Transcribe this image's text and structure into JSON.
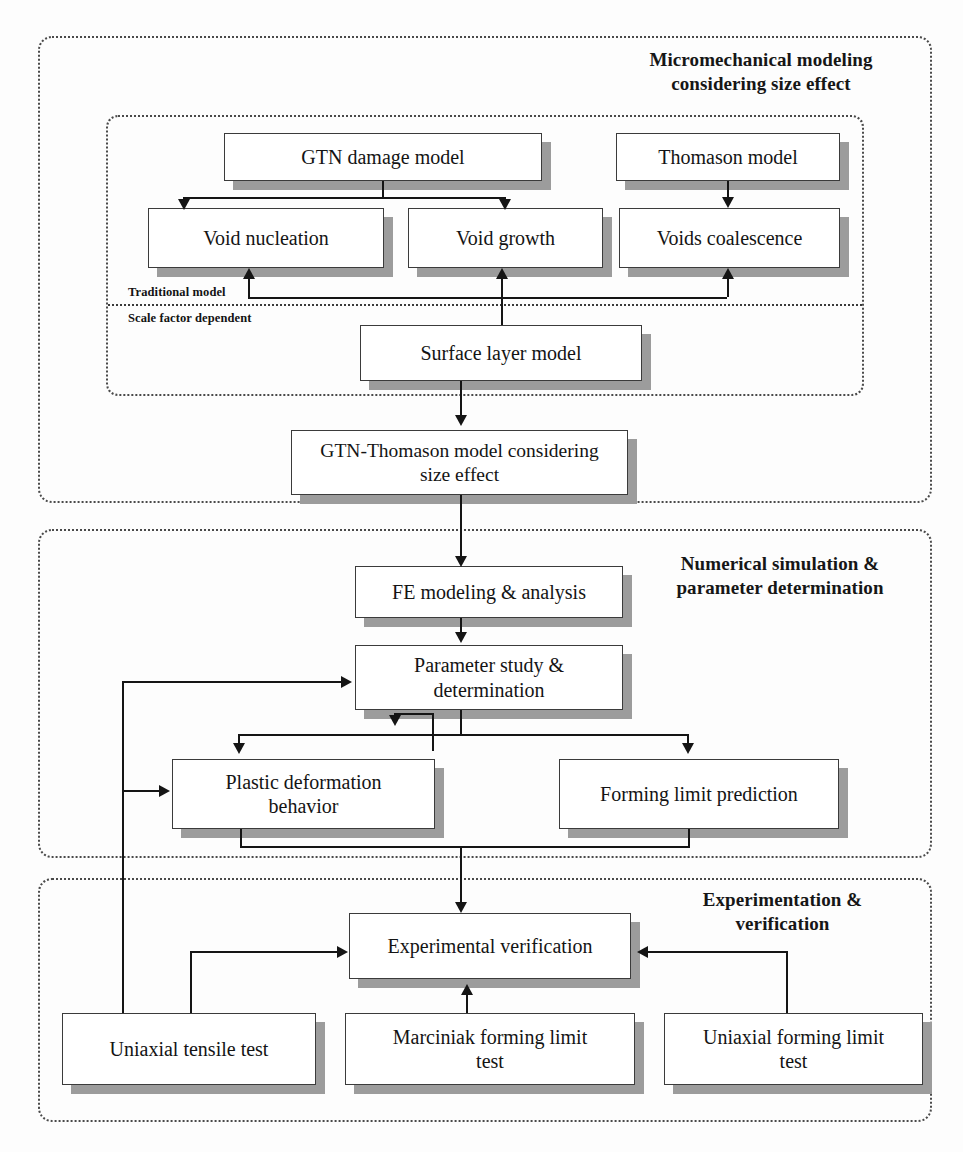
{
  "diagram": {
    "sections": [
      {
        "id": "micromechanical",
        "title_line1": "Micromechanical modeling",
        "title_line2": "considering size effect"
      },
      {
        "id": "numerical",
        "title_line1": "Numerical simulation &",
        "title_line2": "parameter determination"
      },
      {
        "id": "experimentation",
        "title_line1": "Experimentation &",
        "title_line2": "verification"
      }
    ],
    "tags": {
      "traditional_model": "Traditional model",
      "scale_factor_dependent": "Scale factor dependent"
    },
    "nodes": {
      "gtn_damage_model": "GTN damage model",
      "thomason_model": "Thomason model",
      "void_nucleation": "Void nucleation",
      "void_growth": "Void growth",
      "voids_coalescence": "Voids coalescence",
      "surface_layer_model": "Surface layer model",
      "gtn_thomason_line1": "GTN-Thomason model considering",
      "gtn_thomason_line2": "size effect",
      "fe_modeling": "FE modeling & analysis",
      "parameter_study_line1": "Parameter study &",
      "parameter_study_line2": "determination",
      "plastic_deformation_line1": "Plastic deformation",
      "plastic_deformation_line2": "behavior",
      "forming_limit_prediction": "Forming limit prediction",
      "experimental_verification": "Experimental verification",
      "uniaxial_tensile_test": "Uniaxial tensile test",
      "marciniak_line1": "Marciniak forming limit",
      "marciniak_line2": "test",
      "uniaxial_forming_line1": "Uniaxial forming limit",
      "uniaxial_forming_line2": "test"
    },
    "colors": {
      "box_fill": "#ffffff",
      "box_border": "#3b3b3b",
      "box_shadow": "#9c9c9c",
      "line": "#151515",
      "dashed_border": "#4a4a4a",
      "text": "#141414"
    }
  }
}
